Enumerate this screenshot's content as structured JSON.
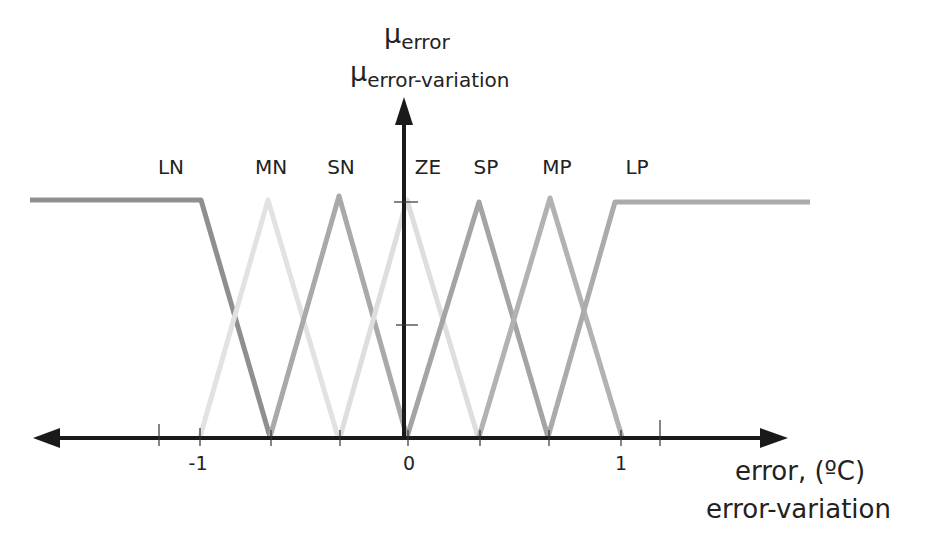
{
  "diagram": {
    "type": "fuzzy-membership-functions",
    "y_axis": {
      "symbol": "μ",
      "title_line1_sub": "error",
      "title_line2_sub": "error-variation",
      "ticks": [
        0.5,
        1
      ]
    },
    "x_axis": {
      "title_line1": "error, (ºC)",
      "title_line2": "error-variation",
      "tick_labels": [
        {
          "value": -1,
          "text": "-1"
        },
        {
          "value": 0,
          "text": "0"
        },
        {
          "value": 1,
          "text": "1"
        }
      ],
      "ticks": [
        -1.2,
        -1,
        -0.667,
        -0.333,
        0,
        0.333,
        0.667,
        1,
        1.2
      ]
    },
    "sets": [
      {
        "name": "LN",
        "shape": "trapezoid-left",
        "points": [
          [
            -2,
            1
          ],
          [
            -1,
            1
          ],
          [
            -0.667,
            0
          ]
        ],
        "color": "#8f8f8f"
      },
      {
        "name": "MN",
        "shape": "triangle",
        "points": [
          [
            -1,
            0
          ],
          [
            -0.667,
            1
          ],
          [
            -0.333,
            0
          ]
        ],
        "color": "#e2e2e2"
      },
      {
        "name": "SN",
        "shape": "triangle",
        "points": [
          [
            -0.667,
            0
          ],
          [
            -0.333,
            1
          ],
          [
            0,
            0
          ]
        ],
        "color": "#a9a9a9"
      },
      {
        "name": "ZE",
        "shape": "triangle",
        "points": [
          [
            -0.333,
            0
          ],
          [
            0,
            1
          ],
          [
            0.333,
            0
          ]
        ],
        "color": "#dedede"
      },
      {
        "name": "SP",
        "shape": "triangle",
        "points": [
          [
            0,
            0
          ],
          [
            0.333,
            1
          ],
          [
            0.667,
            0
          ]
        ],
        "color": "#a4a4a4"
      },
      {
        "name": "MP",
        "shape": "triangle",
        "points": [
          [
            0.333,
            0
          ],
          [
            0.667,
            1
          ],
          [
            1,
            0
          ]
        ],
        "color": "#b2b2b2"
      },
      {
        "name": "LP",
        "shape": "trapezoid-right",
        "points": [
          [
            0.667,
            0
          ],
          [
            1,
            1
          ],
          [
            2,
            1
          ]
        ],
        "color": "#ababab"
      }
    ],
    "colors": {
      "axis": "#1a1a1a",
      "text": "#222222"
    }
  }
}
